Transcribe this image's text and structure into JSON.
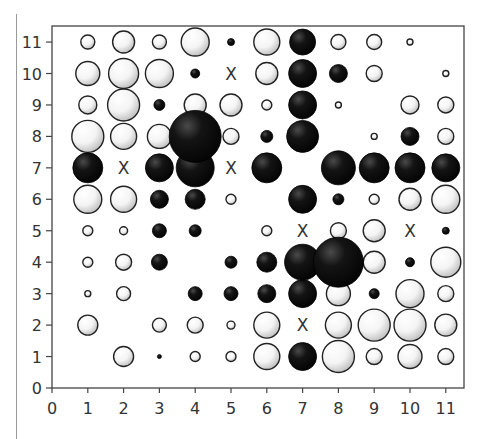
{
  "chart_data": {
    "type": "scatter",
    "subtype": "bubble-grid",
    "title": "",
    "xlabel": "",
    "ylabel": "",
    "xlim": [
      0,
      11
    ],
    "ylim": [
      0,
      11
    ],
    "x_ticks": [
      "0",
      "1",
      "2",
      "3",
      "4",
      "5",
      "6",
      "7",
      "8",
      "9",
      "10",
      "11"
    ],
    "y_ticks": [
      "0",
      "1",
      "2",
      "3",
      "4",
      "5",
      "6",
      "7",
      "8",
      "9",
      "10",
      "11"
    ],
    "grid": false,
    "legend": null,
    "marker_styles": {
      "white": {
        "fill": "#ffffff",
        "shade": "#c8c8c8",
        "stroke": "#222222"
      },
      "black": {
        "fill": "#111111",
        "shade": "#4a4a4a",
        "stroke": "#000000"
      },
      "x": {
        "label": "X",
        "color": "#333333"
      }
    },
    "note": "size = approximate bubble diameter in pixels",
    "points": [
      {
        "x": 1,
        "y": 11,
        "kind": "white",
        "size": 14
      },
      {
        "x": 2,
        "y": 11,
        "kind": "white",
        "size": 22
      },
      {
        "x": 3,
        "y": 11,
        "kind": "white",
        "size": 14
      },
      {
        "x": 4,
        "y": 11,
        "kind": "white",
        "size": 28
      },
      {
        "x": 5,
        "y": 11,
        "kind": "black",
        "size": 7
      },
      {
        "x": 6,
        "y": 11,
        "kind": "white",
        "size": 26
      },
      {
        "x": 7,
        "y": 11,
        "kind": "black",
        "size": 26
      },
      {
        "x": 8,
        "y": 11,
        "kind": "white",
        "size": 15
      },
      {
        "x": 9,
        "y": 11,
        "kind": "white",
        "size": 15
      },
      {
        "x": 10,
        "y": 11,
        "kind": "white",
        "size": 6
      },
      {
        "x": 1,
        "y": 10,
        "kind": "white",
        "size": 24
      },
      {
        "x": 2,
        "y": 10,
        "kind": "white",
        "size": 30
      },
      {
        "x": 3,
        "y": 10,
        "kind": "white",
        "size": 28
      },
      {
        "x": 4,
        "y": 10,
        "kind": "black",
        "size": 9
      },
      {
        "x": 5,
        "y": 10,
        "kind": "x",
        "size": 0
      },
      {
        "x": 6,
        "y": 10,
        "kind": "white",
        "size": 22
      },
      {
        "x": 7,
        "y": 10,
        "kind": "black",
        "size": 28
      },
      {
        "x": 8,
        "y": 10,
        "kind": "black",
        "size": 18
      },
      {
        "x": 9,
        "y": 10,
        "kind": "white",
        "size": 16
      },
      {
        "x": 11,
        "y": 10,
        "kind": "white",
        "size": 6
      },
      {
        "x": 1,
        "y": 9,
        "kind": "white",
        "size": 18
      },
      {
        "x": 2,
        "y": 9,
        "kind": "white",
        "size": 32
      },
      {
        "x": 3,
        "y": 9,
        "kind": "black",
        "size": 11
      },
      {
        "x": 4,
        "y": 9,
        "kind": "white",
        "size": 22
      },
      {
        "x": 5,
        "y": 9,
        "kind": "white",
        "size": 22
      },
      {
        "x": 6,
        "y": 9,
        "kind": "white",
        "size": 10
      },
      {
        "x": 7,
        "y": 9,
        "kind": "black",
        "size": 28
      },
      {
        "x": 8,
        "y": 9,
        "kind": "white",
        "size": 6
      },
      {
        "x": 10,
        "y": 9,
        "kind": "white",
        "size": 18
      },
      {
        "x": 11,
        "y": 9,
        "kind": "white",
        "size": 16
      },
      {
        "x": 1,
        "y": 8,
        "kind": "white",
        "size": 32
      },
      {
        "x": 2,
        "y": 8,
        "kind": "white",
        "size": 26
      },
      {
        "x": 3,
        "y": 8,
        "kind": "white",
        "size": 24
      },
      {
        "x": 4,
        "y": 8,
        "kind": "black",
        "size": 52
      },
      {
        "x": 5,
        "y": 8,
        "kind": "white",
        "size": 16
      },
      {
        "x": 6,
        "y": 8,
        "kind": "black",
        "size": 12
      },
      {
        "x": 7,
        "y": 8,
        "kind": "black",
        "size": 32
      },
      {
        "x": 9,
        "y": 8,
        "kind": "white",
        "size": 6
      },
      {
        "x": 10,
        "y": 8,
        "kind": "black",
        "size": 18
      },
      {
        "x": 11,
        "y": 8,
        "kind": "white",
        "size": 16
      },
      {
        "x": 1,
        "y": 7,
        "kind": "black",
        "size": 30
      },
      {
        "x": 2,
        "y": 7,
        "kind": "x",
        "size": 0
      },
      {
        "x": 3,
        "y": 7,
        "kind": "black",
        "size": 28
      },
      {
        "x": 4,
        "y": 7,
        "kind": "black",
        "size": 38
      },
      {
        "x": 5,
        "y": 7,
        "kind": "x",
        "size": 0
      },
      {
        "x": 6,
        "y": 7,
        "kind": "black",
        "size": 30
      },
      {
        "x": 8,
        "y": 7,
        "kind": "black",
        "size": 34
      },
      {
        "x": 9,
        "y": 7,
        "kind": "black",
        "size": 30
      },
      {
        "x": 10,
        "y": 7,
        "kind": "black",
        "size": 30
      },
      {
        "x": 11,
        "y": 7,
        "kind": "black",
        "size": 28
      },
      {
        "x": 1,
        "y": 6,
        "kind": "white",
        "size": 28
      },
      {
        "x": 2,
        "y": 6,
        "kind": "white",
        "size": 26
      },
      {
        "x": 3,
        "y": 6,
        "kind": "black",
        "size": 18
      },
      {
        "x": 4,
        "y": 6,
        "kind": "black",
        "size": 20
      },
      {
        "x": 5,
        "y": 6,
        "kind": "white",
        "size": 10
      },
      {
        "x": 7,
        "y": 6,
        "kind": "black",
        "size": 28
      },
      {
        "x": 8,
        "y": 6,
        "kind": "black",
        "size": 11
      },
      {
        "x": 9,
        "y": 6,
        "kind": "white",
        "size": 10
      },
      {
        "x": 10,
        "y": 6,
        "kind": "white",
        "size": 22
      },
      {
        "x": 11,
        "y": 6,
        "kind": "white",
        "size": 28
      },
      {
        "x": 1,
        "y": 5,
        "kind": "white",
        "size": 10
      },
      {
        "x": 2,
        "y": 5,
        "kind": "white",
        "size": 8
      },
      {
        "x": 3,
        "y": 5,
        "kind": "black",
        "size": 14
      },
      {
        "x": 4,
        "y": 5,
        "kind": "black",
        "size": 12
      },
      {
        "x": 6,
        "y": 5,
        "kind": "white",
        "size": 10
      },
      {
        "x": 7,
        "y": 5,
        "kind": "x",
        "size": 0
      },
      {
        "x": 8,
        "y": 5,
        "kind": "white",
        "size": 16
      },
      {
        "x": 9,
        "y": 5,
        "kind": "white",
        "size": 22
      },
      {
        "x": 10,
        "y": 5,
        "kind": "x",
        "size": 0
      },
      {
        "x": 11,
        "y": 5,
        "kind": "black",
        "size": 7
      },
      {
        "x": 1,
        "y": 4,
        "kind": "white",
        "size": 10
      },
      {
        "x": 2,
        "y": 4,
        "kind": "white",
        "size": 16
      },
      {
        "x": 3,
        "y": 4,
        "kind": "black",
        "size": 16
      },
      {
        "x": 5,
        "y": 4,
        "kind": "black",
        "size": 12
      },
      {
        "x": 6,
        "y": 4,
        "kind": "black",
        "size": 20
      },
      {
        "x": 7,
        "y": 4,
        "kind": "black",
        "size": 36
      },
      {
        "x": 8,
        "y": 4,
        "kind": "black",
        "size": 50
      },
      {
        "x": 9,
        "y": 4,
        "kind": "white",
        "size": 22
      },
      {
        "x": 10,
        "y": 4,
        "kind": "black",
        "size": 9
      },
      {
        "x": 11,
        "y": 4,
        "kind": "white",
        "size": 30
      },
      {
        "x": 1,
        "y": 3,
        "kind": "white",
        "size": 6
      },
      {
        "x": 2,
        "y": 3,
        "kind": "white",
        "size": 14
      },
      {
        "x": 4,
        "y": 3,
        "kind": "black",
        "size": 14
      },
      {
        "x": 5,
        "y": 3,
        "kind": "black",
        "size": 14
      },
      {
        "x": 6,
        "y": 3,
        "kind": "black",
        "size": 18
      },
      {
        "x": 7,
        "y": 3,
        "kind": "black",
        "size": 28
      },
      {
        "x": 8,
        "y": 3,
        "kind": "white",
        "size": 24
      },
      {
        "x": 9,
        "y": 3,
        "kind": "black",
        "size": 10
      },
      {
        "x": 10,
        "y": 3,
        "kind": "white",
        "size": 28
      },
      {
        "x": 11,
        "y": 3,
        "kind": "white",
        "size": 16
      },
      {
        "x": 1,
        "y": 2,
        "kind": "white",
        "size": 20
      },
      {
        "x": 3,
        "y": 2,
        "kind": "white",
        "size": 14
      },
      {
        "x": 4,
        "y": 2,
        "kind": "white",
        "size": 16
      },
      {
        "x": 5,
        "y": 2,
        "kind": "white",
        "size": 8
      },
      {
        "x": 6,
        "y": 2,
        "kind": "white",
        "size": 26
      },
      {
        "x": 7,
        "y": 2,
        "kind": "x",
        "size": 0
      },
      {
        "x": 8,
        "y": 2,
        "kind": "white",
        "size": 26
      },
      {
        "x": 9,
        "y": 2,
        "kind": "white",
        "size": 32
      },
      {
        "x": 10,
        "y": 2,
        "kind": "white",
        "size": 32
      },
      {
        "x": 11,
        "y": 2,
        "kind": "white",
        "size": 22
      },
      {
        "x": 2,
        "y": 1,
        "kind": "white",
        "size": 20
      },
      {
        "x": 3,
        "y": 1,
        "kind": "black",
        "size": 4
      },
      {
        "x": 4,
        "y": 1,
        "kind": "white",
        "size": 10
      },
      {
        "x": 5,
        "y": 1,
        "kind": "white",
        "size": 10
      },
      {
        "x": 6,
        "y": 1,
        "kind": "white",
        "size": 26
      },
      {
        "x": 7,
        "y": 1,
        "kind": "black",
        "size": 28
      },
      {
        "x": 8,
        "y": 1,
        "kind": "white",
        "size": 32
      },
      {
        "x": 9,
        "y": 1,
        "kind": "white",
        "size": 16
      },
      {
        "x": 10,
        "y": 1,
        "kind": "white",
        "size": 24
      },
      {
        "x": 11,
        "y": 1,
        "kind": "white",
        "size": 16
      }
    ]
  },
  "layout": {
    "plot_left": 52,
    "plot_top": 26,
    "plot_right": 464,
    "plot_bottom": 388,
    "x_unit_px": 35.8,
    "y_unit_px": 31.45
  }
}
